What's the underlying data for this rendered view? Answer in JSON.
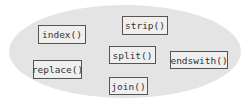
{
  "diagram": {
    "container": {
      "shape": "ellipse",
      "fill": "#e4e4e4"
    },
    "methods": [
      {
        "label": "index()"
      },
      {
        "label": "strip()"
      },
      {
        "label": "split()"
      },
      {
        "label": "endswith()"
      },
      {
        "label": "replace()"
      },
      {
        "label": "join()"
      }
    ]
  }
}
